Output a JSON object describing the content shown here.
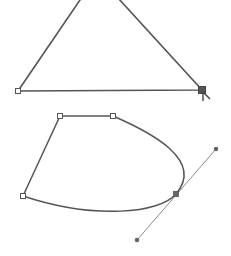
{
  "canvas": {
    "width": 231,
    "height": 256,
    "background": "#ffffff",
    "stroke_color": "#555555",
    "handle_line_color": "#888888",
    "anchor_fill": "#ffffff",
    "anchor_stroke": "#555555",
    "selected_anchor_fill": "#555555",
    "handle_point_fill": "#666666"
  },
  "shapes": [
    {
      "name": "triangle-path",
      "apex": [
        97,
        -25
      ],
      "anchors": [
        {
          "name": "bottom-left",
          "x": 18,
          "y": 91,
          "selected": false
        },
        {
          "name": "bottom-right",
          "x": 202,
          "y": 90,
          "selected": true
        }
      ]
    },
    {
      "name": "curve-path",
      "anchors": [
        {
          "name": "left",
          "x": 23,
          "y": 196,
          "selected": false
        },
        {
          "name": "top-left",
          "x": 60,
          "y": 116,
          "selected": false
        },
        {
          "name": "top-right",
          "x": 113,
          "y": 116,
          "selected": false
        },
        {
          "name": "smooth-point",
          "x": 176,
          "y": 194,
          "selected": true
        }
      ],
      "handles": [
        {
          "name": "handle-out",
          "x": 216,
          "y": 149
        },
        {
          "name": "handle-in",
          "x": 137,
          "y": 240
        }
      ]
    }
  ],
  "cursor": {
    "icon": "direct-selection-arrow-icon",
    "x": 203,
    "y": 92
  }
}
